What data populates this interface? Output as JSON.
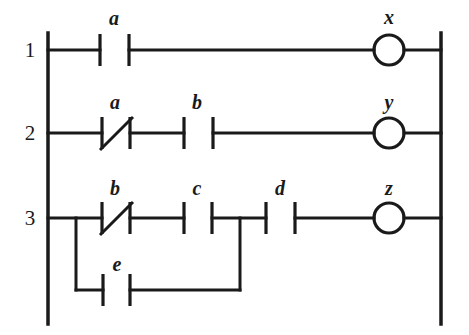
{
  "diagram": {
    "kind": "ladder-logic-diagram",
    "ink_color": "#1a1a1a",
    "background_color": "#ffffff",
    "rails": {
      "left_x": 48,
      "right_x": 441,
      "top_y": 33,
      "bottom_y": 324
    },
    "rungs": [
      {
        "number": "1",
        "number_x": 30,
        "y": 50,
        "elements": [
          {
            "type": "contact-no",
            "label": "a",
            "label_x": 114,
            "label_y": 20,
            "left_bar_x": 100,
            "right_bar_x": 129
          },
          {
            "type": "coil",
            "label": "x",
            "label_x": 389,
            "label_y": 19,
            "center_x": 389,
            "radius": 15
          }
        ]
      },
      {
        "number": "2",
        "number_x": 30,
        "y": 133,
        "elements": [
          {
            "type": "contact-nc",
            "label": "a",
            "label_x": 115,
            "label_y": 104,
            "left_bar_x": 102,
            "right_bar_x": 130
          },
          {
            "type": "contact-no",
            "label": "b",
            "label_x": 197,
            "label_y": 104,
            "left_bar_x": 184,
            "right_bar_x": 213
          },
          {
            "type": "coil",
            "label": "y",
            "label_x": 389,
            "label_y": 104,
            "center_x": 389,
            "radius": 15
          }
        ]
      },
      {
        "number": "3",
        "number_x": 30,
        "y": 218,
        "elements": [
          {
            "type": "contact-nc",
            "label": "b",
            "label_x": 115,
            "label_y": 190,
            "left_bar_x": 102,
            "right_bar_x": 130
          },
          {
            "type": "contact-no",
            "label": "c",
            "label_x": 197,
            "label_y": 190,
            "left_bar_x": 184,
            "right_bar_x": 212
          },
          {
            "type": "contact-no",
            "label": "d",
            "label_x": 280,
            "label_y": 190,
            "left_bar_x": 266,
            "right_bar_x": 295
          },
          {
            "type": "coil",
            "label": "z",
            "label_x": 389,
            "label_y": 190,
            "center_x": 389,
            "radius": 15
          }
        ],
        "branch": {
          "y": 290,
          "start_x": 76,
          "rejoin_x": 240,
          "element": {
            "type": "contact-no",
            "label": "e",
            "label_x": 117,
            "label_y": 266,
            "left_bar_x": 103,
            "right_bar_x": 130
          }
        }
      }
    ],
    "contact_bar_half_height": 16,
    "coil_label_text": {
      "rung1": "x",
      "rung2": "y",
      "rung3": "z"
    }
  }
}
